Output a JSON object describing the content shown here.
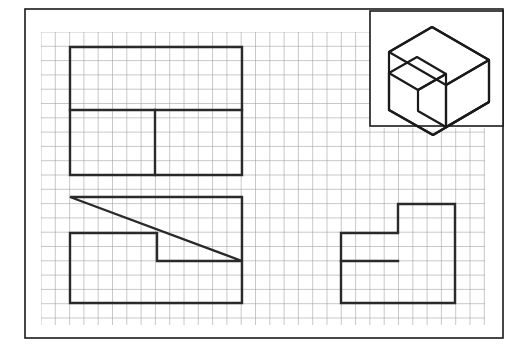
{
  "sheet": {
    "background_color": "#ffffff",
    "border_color": "#1a1a1a",
    "border_rect": {
      "x": 25,
      "y": 9,
      "width": 478,
      "height": 329
    },
    "border_width": 1.6
  },
  "grid": {
    "color": "#9a9a9a",
    "line_width": 0.55,
    "cell_size": 14.3,
    "origin_x": 41,
    "origin_y": 32,
    "cols": 31,
    "rows": 20.5,
    "right": 485,
    "bottom": 325,
    "notch": {
      "x": 370,
      "y": 128,
      "note": "grid is interrupted by the isometric inset box in the upper-right corner"
    }
  },
  "isometric_inset": {
    "label": "pictorial-view",
    "box": {
      "x": 370,
      "y": 11,
      "width": 133,
      "height": 115
    },
    "box_color": "#1a1a1a",
    "box_width": 1.6,
    "line_color": "#1a1a1a",
    "line_width": 2.2,
    "description": "isometric pictorial of a stepped block with an upper rear ledge and a lower front step"
  },
  "views": {
    "line_color": "#2a2a2a",
    "line_width": 2.4,
    "top_view": {
      "name": "top-view",
      "label": "top view",
      "outline": [
        [
          70,
          47
        ],
        [
          242,
          47
        ],
        [
          242,
          175
        ],
        [
          70,
          175
        ]
      ],
      "internal_lines": [
        {
          "name": "horizontal-divider",
          "from": [
            70,
            110
          ],
          "to": [
            242,
            110
          ]
        },
        {
          "name": "vertical-divider",
          "from": [
            155,
            110
          ],
          "to": [
            155,
            175
          ]
        }
      ],
      "width_px": 172,
      "height_px": 128
    },
    "front_view": {
      "name": "front-view",
      "label": "front view",
      "outline": [
        [
          70,
          197
        ],
        [
          242,
          197
        ],
        [
          242,
          261
        ],
        [
          157,
          261
        ],
        [
          157,
          233
        ],
        [
          70,
          233
        ]
      ],
      "internal_lines": [],
      "closing_note": "outline continues down left edge to bottom at y=303 and across to x=242",
      "full_path": [
        [
          70,
          197
        ],
        [
          242,
          197
        ],
        [
          242,
          303
        ],
        [
          70,
          303
        ],
        [
          70,
          233
        ],
        [
          157,
          233
        ],
        [
          157,
          261
        ],
        [
          242,
          261
        ]
      ],
      "width_px": 172,
      "height_px": 106
    },
    "side_view": {
      "name": "side-view",
      "label": "side view",
      "outline": [
        [
          341,
          233
        ],
        [
          398,
          233
        ],
        [
          398,
          204
        ],
        [
          455,
          204
        ],
        [
          455,
          303
        ],
        [
          341,
          303
        ]
      ],
      "internal_lines": [
        {
          "name": "step-ledge",
          "from": [
            341,
            261
          ],
          "to": [
            398,
            261
          ]
        }
      ],
      "width_px": 114,
      "height_px": 99
    }
  },
  "chart_data": {
    "type": "table",
    "categories": [
      "top view",
      "front view",
      "side view",
      "isometric pictorial"
    ],
    "values": [
      4,
      6,
      6,
      1
    ],
    "xlabel": "view",
    "ylabel": "outline vertices",
    "note": "Engineering drawing worksheet on square grid paper; three orthographic views plus one boxed isometric pictorial."
  }
}
